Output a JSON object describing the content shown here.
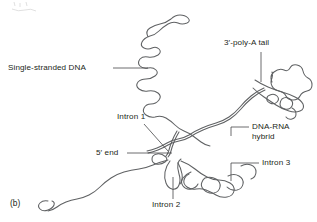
{
  "figure": {
    "panel_label": "(b)",
    "background_color": "#ffffff",
    "line_color": "#5f6163",
    "text_color": "#231f20",
    "width": 317,
    "height": 222,
    "labels": {
      "single_stranded_dna": "Single-stranded DNA",
      "poly_a_tail": "3′-poly-A tail",
      "dna_rna_hybrid": "DNA-RNA\nhybrid",
      "intron_1": "Intron 1",
      "intron_2": "Intron 2",
      "intron_3": "Intron 3",
      "five_prime_end": "5′ end"
    }
  }
}
